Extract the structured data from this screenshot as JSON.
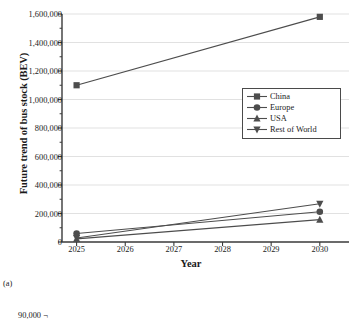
{
  "figure": {
    "caption": "(a)",
    "next_figure_top_ylabel": "90,000 ¬"
  },
  "chart_data": {
    "type": "line",
    "title": "",
    "xlabel": "Year",
    "ylabel": "Future trend of bus stock (BEV)",
    "x": [
      2025,
      2030
    ],
    "xticks": [
      "2025",
      "2026",
      "2027",
      "2028",
      "2029",
      "2030"
    ],
    "xlim": [
      2024.7,
      2030.6
    ],
    "ylim": [
      0,
      1600000
    ],
    "yticks": [
      0,
      200000,
      400000,
      600000,
      800000,
      1000000,
      1200000,
      1400000,
      1600000
    ],
    "ytick_labels": [
      "0",
      "200,000",
      "400,000",
      "600,000",
      "800,000",
      "1,000,000",
      "1,200,000",
      "1,400,000",
      "1,600,000"
    ],
    "grid": true,
    "grid_color": "#d9d9d9",
    "legend_position": "center-right",
    "series": [
      {
        "name": "China",
        "marker": "square",
        "color": "#4d4d4d",
        "values": [
          1100000,
          1580000
        ]
      },
      {
        "name": "Europe",
        "marker": "circle",
        "color": "#4d4d4d",
        "values": [
          60000,
          212000
        ]
      },
      {
        "name": "USA",
        "marker": "triangle-up",
        "color": "#4d4d4d",
        "values": [
          22000,
          157000
        ]
      },
      {
        "name": "Rest of World",
        "marker": "triangle-down",
        "color": "#4d4d4d",
        "values": [
          28000,
          268000
        ]
      }
    ]
  }
}
